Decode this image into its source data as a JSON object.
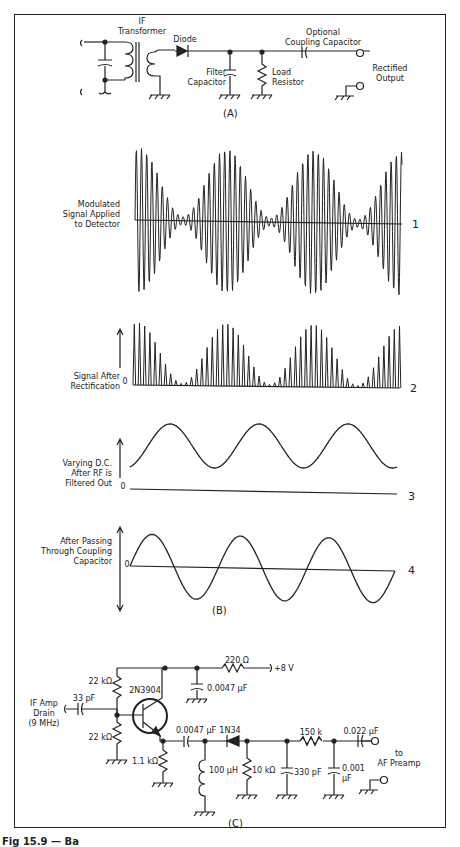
{
  "figure": {
    "caption_fragment": "Fig 15.9 — Ba",
    "panels": [
      "(A)",
      "(B)",
      "(C)"
    ]
  },
  "panel_a": {
    "labels": {
      "if_transformer": "IF\nTransformer",
      "diode": "Diode",
      "filter_capacitor": "Filter\nCapacitor",
      "load_resistor": "Load\nResistor",
      "coupling_capacitor": "Optional\nCoupling Capacitor",
      "rectified_output": "Rectified\nOutput"
    },
    "caption": "(A)"
  },
  "panel_b": {
    "caption": "(B)",
    "waveforms": [
      {
        "id": 1,
        "number": "1",
        "label": "Modulated\nSignal Applied\nto Detector",
        "zero": ""
      },
      {
        "id": 2,
        "number": "2",
        "label": "Signal After\nRectification",
        "zero": "0"
      },
      {
        "id": 3,
        "number": "3",
        "label": "Varying D.C.\nAfter RF is\nFiltered Out",
        "zero": "0"
      },
      {
        "id": 4,
        "number": "4",
        "label": "After Passing\nThrough Coupling\nCapacitor",
        "zero": "0"
      }
    ]
  },
  "panel_c": {
    "caption": "(C)",
    "labels": {
      "input": "IF Amp\nDrain\n(9 MHz)",
      "c_in": "33 pF",
      "r_top": "22 kΩ",
      "r_bottom": "22 kΩ",
      "transistor": "2N3904",
      "r_emitter": "1.1 kΩ",
      "r_supply": "220 Ω",
      "supply": "+8 V",
      "c_bypass": "0.0047 µF",
      "c_couple": "0.0047 µF",
      "diode": "1N34",
      "inductor": "100 µH",
      "r_load": "10 kΩ",
      "c_filter1": "330 pF",
      "r_filter": "150 k",
      "c_filter2": "0.001\nµF",
      "c_out": "0.022 µF",
      "output": "to\nAF Preamp"
    }
  }
}
